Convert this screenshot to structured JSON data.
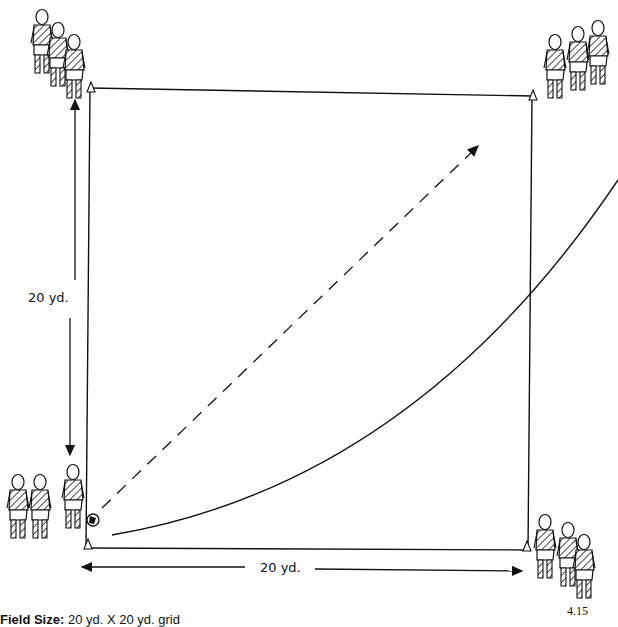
{
  "diagram": {
    "field": {
      "width_label": "20 yd.",
      "height_label": "20 yd."
    },
    "cones": [
      {
        "position": "top-left"
      },
      {
        "position": "top-right"
      },
      {
        "position": "bottom-left"
      },
      {
        "position": "bottom-right"
      }
    ],
    "player_groups": [
      {
        "position": "top-left",
        "count": 3
      },
      {
        "position": "top-right",
        "count": 3
      },
      {
        "position": "bottom-left",
        "count": 3,
        "with_ball": true
      },
      {
        "position": "bottom-right",
        "count": 3
      }
    ],
    "paths": [
      {
        "type": "pass",
        "style": "dashed-arrow",
        "from": "bottom-left",
        "to": "top-right"
      },
      {
        "type": "run",
        "style": "solid-curve",
        "from": "bottom-left",
        "to": "right-outside"
      }
    ]
  },
  "caption": {
    "label": "Field Size:",
    "value": "20 yd. X 20 yd. grid"
  },
  "figure_number": "4.15"
}
